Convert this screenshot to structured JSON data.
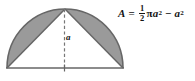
{
  "figure": {
    "name": "semicircle-minus-triangle-area-figure",
    "background_color": "#ffffff",
    "shaded_color": "#9a9a9a",
    "outline_color": "#555555",
    "text_color": "#141414"
  },
  "diagram": {
    "name": "semicircle-with-inscribed-triangle",
    "semicircle": {
      "center_x": 64.5,
      "base_y": 68,
      "radius": 58,
      "left_vertex_x": 7,
      "right_vertex_x": 122,
      "apex_x": 64.5,
      "apex_y": 9
    },
    "triangle": {
      "fill": "white",
      "vertices": "left base, apex, right base"
    },
    "altitude": {
      "label": "a",
      "style": "dashed",
      "from_y": 9,
      "to_y": 68
    },
    "base_tick": {
      "present": true,
      "x": 64.5
    }
  },
  "formula": {
    "name": "area-formula",
    "lhs": "A",
    "equals": "=",
    "fraction_numerator": "1",
    "fraction_denominator": "2",
    "pi": "π",
    "variable": "a",
    "exponent": "2",
    "minus": "−",
    "plain_text": "A = 1/2 πa² − a²"
  }
}
